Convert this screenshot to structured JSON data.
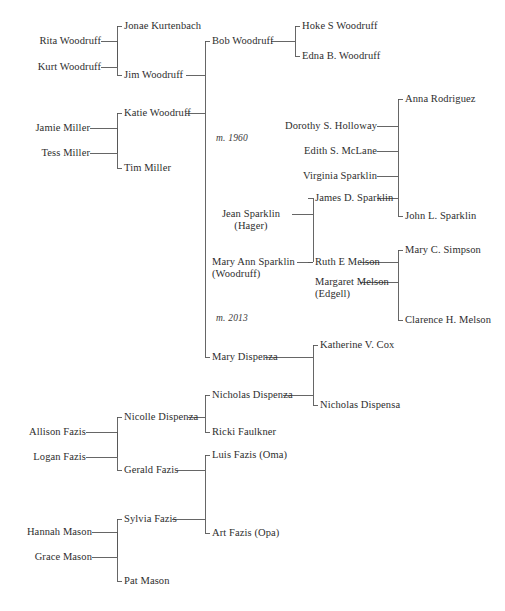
{
  "diagram": {
    "type": "family-tree",
    "title": "",
    "background_color": "#ffffff",
    "line_color": "#555555",
    "text_color": "#2e2e2e"
  },
  "marriages": [
    {
      "id": "m1",
      "label": "m. 1960"
    },
    {
      "id": "m2",
      "label": "m. 2013"
    }
  ],
  "people": {
    "rita_woodruff": "Rita Woodruff",
    "kurt_woodruff": "Kurt Woodruff",
    "jamie_miller": "Jamie Miller",
    "tess_miller": "Tess Miller",
    "jonae_kurtenbach": "Jonae Kurtenbach",
    "jim_woodruff": "Jim Woodruff",
    "katie_woodruff": "Katie Woodruff",
    "tim_miller": "Tim Miller",
    "bob_woodruff": "Bob Woodruff",
    "hoke_s_woodruff": "Hoke S Woodruff",
    "edna_b_woodruff": "Edna B. Woodruff",
    "anna_rodriguez": "Anna Rodriguez",
    "dorothy_s_holloway": "Dorothy S. Holloway",
    "edith_s_mclane": "Edith S. McLane",
    "virginia_sparklin": "Virginia Sparklin",
    "james_d_sparklin": "James D. Sparklin",
    "john_l_sparklin": "John L. Sparklin",
    "jean_sparklin": "Jean Sparklin",
    "jean_sparklin_sub": "(Hager)",
    "mary_ann_sparklin": "Mary Ann Sparklin",
    "mary_ann_sparklin_sub": "(Woodruff)",
    "ruth_e_melson": "Ruth E Melson",
    "mary_c_simpson": "Mary C. Simpson",
    "margaret_melson": "Margaret Melson",
    "margaret_melson_sub": "(Edgell)",
    "clarence_h_melson": "Clarence H. Melson",
    "mary_dispenza": "Mary Dispenza",
    "katherine_v_cox": "Katherine V. Cox",
    "nicholas_dispenza": "Nicholas Dispenza",
    "nicholas_dispensa": "Nicholas Dispensa",
    "nicolle_dispenza": "Nicolle Dispenza",
    "ricki_faulkner": "Ricki Faulkner",
    "allison_fazis": "Allison Fazis",
    "logan_fazis": "Logan Fazis",
    "gerald_fazis": "Gerald Fazis",
    "luis_fazis_oma": "Luis Fazis (Oma)",
    "art_fazis_opa": "Art Fazis (Opa)",
    "hannah_mason": "Hannah Mason",
    "grace_mason": "Grace Mason",
    "sylvia_fazis": "Sylvia Fazis",
    "pat_mason": "Pat Mason"
  }
}
